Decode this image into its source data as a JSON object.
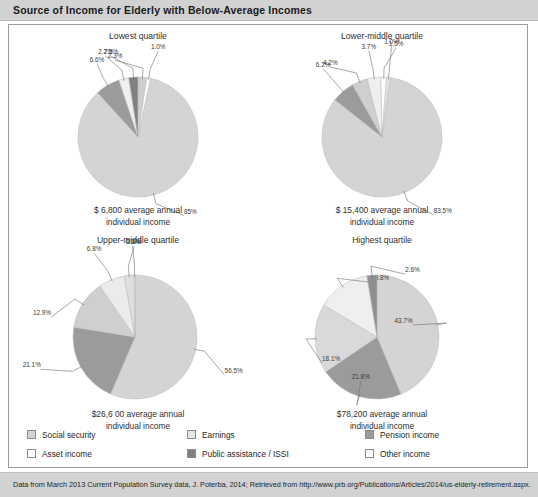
{
  "header": {
    "title": "Source of Income for Elderly with Below-Average Incomes"
  },
  "footer": {
    "source": "Data from March 2013 Current Population Survey data, J. Poterba, 2014; Retrieved from http://www.prb.org/Publications/Articles/2014/us-elderly-retirement.aspx."
  },
  "legend": {
    "items": [
      {
        "label": "Social security",
        "color": "#d4d4d4"
      },
      {
        "label": "Earnings",
        "color": "#e6e6e6"
      },
      {
        "label": "Pension income",
        "color": "#9b9b9b"
      },
      {
        "label": "Asset income",
        "color": "#ffffff"
      },
      {
        "label": "Public assistance / ISSI",
        "color": "#808080"
      },
      {
        "label": "Other income",
        "color": "#fdfdfd"
      }
    ]
  },
  "chart_data": [
    {
      "type": "pie",
      "title": "Lowest quartile",
      "caption_line1": "$ 6,800 average annual",
      "caption_line2": "individual income",
      "categories": [
        "Social security",
        "Earnings",
        "Pension income",
        "Public assistance / ISSI",
        "Asset income",
        "Other income"
      ],
      "values": [
        85,
        6.6,
        2.7,
        2.5,
        2.3,
        1.0
      ],
      "labels": [
        "85%",
        "6.6%",
        "2.7%",
        "2.5%",
        "2.3%",
        "1.0%"
      ],
      "colors": [
        "#d4d4d4",
        "#9b9b9b",
        "#efefef",
        "#808080",
        "#cfcfcf",
        "#fdfdfd"
      ]
    },
    {
      "type": "pie",
      "title": "Lower-middle quartile",
      "caption_line1": "$ 15,400 average annual",
      "caption_line2": "individual income",
      "categories": [
        "Social security",
        "Pension income",
        "Earnings",
        "Public assistance / ISSI",
        "Asset income",
        "Other income"
      ],
      "values": [
        83.5,
        6.2,
        4.2,
        3.7,
        1.5,
        1.0
      ],
      "labels": [
        "83.5%",
        "6.2%",
        "4.2%",
        "3.7%",
        "1.5%",
        "1.0%"
      ],
      "colors": [
        "#d4d4d4",
        "#9b9b9b",
        "#cfcfcf",
        "#efefef",
        "#fdfdfd",
        "#e2e2e2"
      ]
    },
    {
      "type": "pie",
      "title": "Upper-middle quartile",
      "caption_line1": "$26,6 00 average annual",
      "caption_line2": "individual income",
      "categories": [
        "Social security",
        "Pension income",
        "Earnings",
        "Asset income",
        "Other income",
        "Public assistance / ISSI"
      ],
      "values": [
        56.5,
        21.1,
        12.9,
        6.8,
        2.6,
        0.2
      ],
      "labels": [
        "56.5%",
        "21.1%",
        "12.9%",
        "6.8%",
        "2.6%",
        "0.2%"
      ],
      "colors": [
        "#d4d4d4",
        "#9b9b9b",
        "#cfcfcf",
        "#ebebeb",
        "#dedede",
        "#fdfdfd"
      ]
    },
    {
      "type": "pie",
      "title": "Highest quartile",
      "caption_line1": "$78,200 average annual",
      "caption_line2": "individual income",
      "categories": [
        "Social security",
        "Pension income",
        "Earnings",
        "Asset income",
        "Public assistance / ISSI"
      ],
      "values": [
        43.7,
        21.8,
        18.1,
        13.8,
        2.6
      ],
      "labels": [
        "43.7%",
        "21.8%",
        "18.1%",
        "13.8%",
        "2.6%"
      ],
      "colors": [
        "#d4d4d4",
        "#9b9b9b",
        "#d9d9d9",
        "#efefef",
        "#8f8f8f"
      ]
    }
  ]
}
